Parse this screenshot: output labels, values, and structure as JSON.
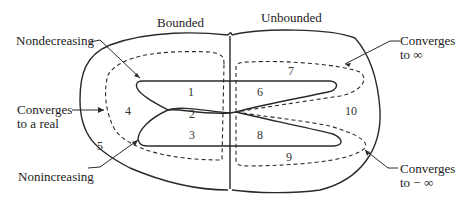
{
  "diagram": {
    "title_regions": {
      "left": "Bounded",
      "right": "Unbounded"
    },
    "callouts": {
      "nondecreasing": "Nondecreasing",
      "converges_real_line1": "Converges",
      "converges_real_line2": "to a real",
      "nonincreasing": "Nonincreasing",
      "converges_inf_line1": "Converges",
      "converges_inf_line2": "to  ∞",
      "converges_neginf_line1": "Converges",
      "converges_neginf_line2": "to  − ∞"
    },
    "region_numbers": [
      "1",
      "2",
      "3",
      "4",
      "5",
      "6",
      "7",
      "8",
      "9",
      "10"
    ],
    "colors": {
      "stroke": "#2a2a2a",
      "background": "#ffffff"
    }
  }
}
